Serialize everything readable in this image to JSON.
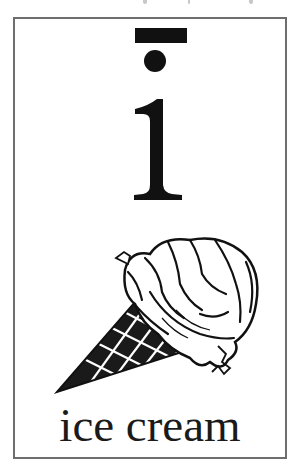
{
  "card": {
    "letter": "i",
    "diacritic": "macron",
    "word": "ice cream",
    "illustration": "ice-cream-cone",
    "colors": {
      "ink": "#111111",
      "border": "#6e6e6e",
      "background": "#ffffff"
    }
  }
}
